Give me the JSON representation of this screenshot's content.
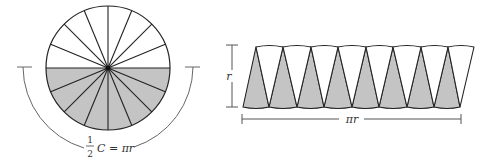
{
  "figure": {
    "colors": {
      "shade": "#c4c4c4",
      "stroke": "#222222",
      "annotation": "#555555",
      "background": "#ffffff"
    },
    "circle": {
      "sector_count": 16,
      "shaded_half": "bottom",
      "arc_label": {
        "fraction_num": "1",
        "fraction_den": "2",
        "text": "C = πr"
      }
    },
    "strip": {
      "shaded_triangles": 8,
      "unshaded_triangles": 8,
      "height_label": "r",
      "width_label": "πr"
    }
  }
}
